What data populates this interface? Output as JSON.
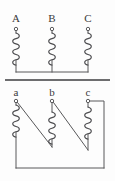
{
  "figure": {
    "kind": "diagram",
    "width": 115,
    "height": 181,
    "background_color": "#fdfdfd",
    "line_color": "#58585a",
    "core_color": "#6d6d6f",
    "label_color": "#3a3a3c"
  },
  "primary": {
    "name": "primary-winding-group",
    "connection": "wye",
    "terminals": [
      {
        "label": "A",
        "x": 16,
        "y": 29,
        "label_x": 11,
        "label_y": 13
      },
      {
        "label": "B",
        "x": 52,
        "y": 29,
        "label_x": 47,
        "label_y": 13
      },
      {
        "label": "C",
        "x": 88,
        "y": 29,
        "label_x": 83,
        "label_y": 13
      }
    ],
    "coil_top_y": 32,
    "coil_bottom_y": 64,
    "neutral_y": 72,
    "neutral_left_x": 16,
    "neutral_right_x": 88
  },
  "core": {
    "name": "transformer-core-line",
    "x1": 5,
    "x2": 110,
    "y": 80
  },
  "secondary": {
    "name": "secondary-winding-group",
    "connection": "delta",
    "terminals": [
      {
        "label": "a",
        "x": 16,
        "y": 101,
        "label_x": 11,
        "label_y": 88
      },
      {
        "label": "b",
        "x": 52,
        "y": 101,
        "label_x": 47,
        "label_y": 88
      },
      {
        "label": "c",
        "x": 88,
        "y": 101,
        "label_x": 83,
        "label_y": 88
      }
    ],
    "coil_top_y": 104,
    "coil_bottom_y": 145,
    "return_bus_y": 168,
    "return_bus_left_x": 16,
    "return_bus_right_x": 104,
    "right_riser_x": 104
  },
  "labels": {
    "primary": [
      "A",
      "B",
      "C"
    ],
    "secondary": [
      "a",
      "b",
      "c"
    ]
  }
}
